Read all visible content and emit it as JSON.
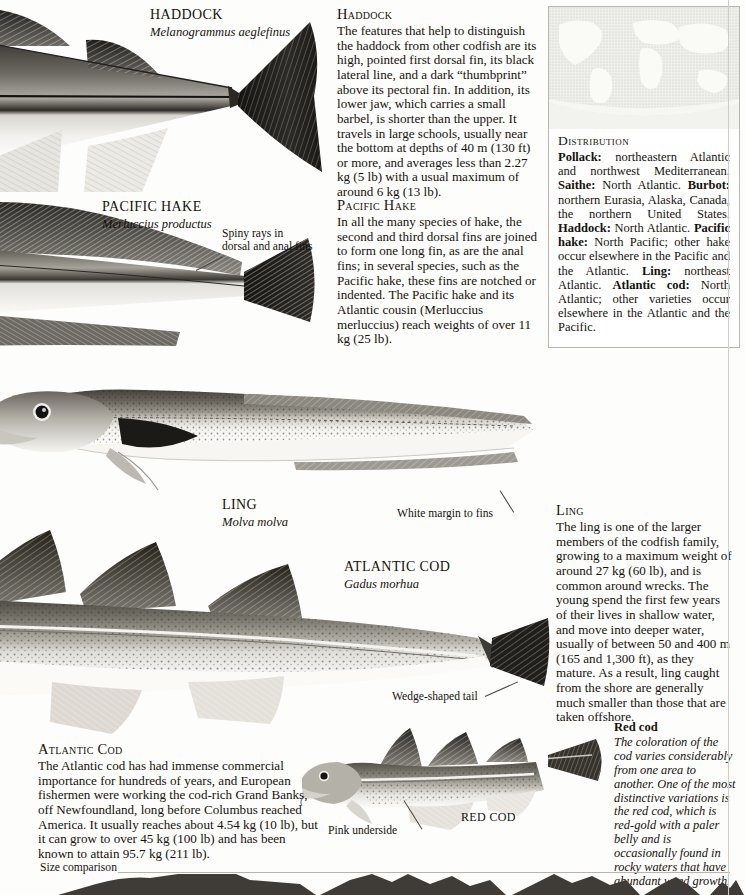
{
  "page": {
    "edge_title": "COD, HAKE, LING & BURBOT",
    "background_color": "#fdfdfb",
    "ink_color": "#15120d"
  },
  "specimens": [
    {
      "id": "haddock",
      "common_name": "HADDOCK",
      "scientific_name": "Melanogrammus aeglefinus"
    },
    {
      "id": "pacific-hake",
      "common_name": "PACIFIC HAKE",
      "scientific_name": "Merluccius productus"
    },
    {
      "id": "ling",
      "common_name": "LING",
      "scientific_name": "Molva molva"
    },
    {
      "id": "atlantic-cod",
      "common_name": "ATLANTIC COD",
      "scientific_name": "Gadus morhua"
    },
    {
      "id": "red-cod",
      "common_name": "RED COD",
      "scientific_name": ""
    }
  ],
  "callouts": {
    "spiny_rays": "Spiny rays in\ndorsal and anal fins",
    "spiny_rays_l1": "Spiny rays in",
    "spiny_rays_l2": "dorsal and anal fins",
    "white_margin": "White margin to fins",
    "wedge_tail": "Wedge-shaped tail",
    "pink_underside": "Pink underside"
  },
  "articles": [
    {
      "id": "haddock-article",
      "heading": "Haddock",
      "body": "The features that help to distinguish the haddock from other codfish are its high, pointed first dorsal fin, its black lateral line, and a dark “thumbprint” above its pectoral fin. In addition, its lower jaw, which carries a small barbel, is shorter than the upper. It travels in large schools, usually near the bottom at depths of 40 m (130 ft) or more, and averages less than 2.27 kg (5 lb) with a usual maximum of around 6 kg (13 lb)."
    },
    {
      "id": "pacific-hake-article",
      "heading": "Pacific Hake",
      "body": "In all the many species of hake, the second and third dorsal fins are joined to form one long fin, as are the anal fins; in several species, such as the Pacific hake, these fins are notched or indented. The Pacific hake and its Atlantic cousin (Merluccius merluccius) reach weights of over 11 kg (25 lb)."
    },
    {
      "id": "ling-article",
      "heading": "Ling",
      "body": "The ling is one of the larger members of the codfish family, growing to a maximum weight of around 27 kg (60 lb), and is common around wrecks. The young spend the first few years of their lives in shallow water, and move into deeper water, usually of between 50 and 400 m (165 and 1,300 ft), as they mature. As a result, ling caught from the shore are generally much smaller than those that are taken offshore."
    },
    {
      "id": "atlantic-cod-article",
      "heading": "Atlantic Cod",
      "body": "The Atlantic cod has had immense commercial importance for hundreds of years, and European fishermen were working the cod-rich Grand Banks, off Newfoundland, long before Columbus reached America. It usually reaches about 4.54 kg (10 lb), but it can grow to over 45 kg (100 lb) and has been known to attain 95.7 kg (211 lb)."
    }
  ],
  "distribution": {
    "title": "Distribution",
    "entries": [
      {
        "species": "Pollack:",
        "range": " northeastern Atlantic and northwest Mediterranean."
      },
      {
        "species": "Saithe:",
        "range": " North Atlantic."
      },
      {
        "species": "Burbot:",
        "range": " northern Eurasia, Alaska, Canada, the northern United States."
      },
      {
        "species": "Haddock:",
        "range": " North Atlantic."
      },
      {
        "species": "Pacific hake:",
        "range": " North Pacific; other hake occur elsewhere in the Pacific and the Atlantic."
      },
      {
        "species": "Ling:",
        "range": " northeast Atlantic."
      },
      {
        "species": "Atlantic cod:",
        "range": " North Atlantic; other varieties occur elsewhere in the Atlantic and the Pacific."
      }
    ]
  },
  "red_cod_note": {
    "heading": "Red cod",
    "body": "The coloration of the cod varies considerably from one area to another. One of the most distinctive variations is the red cod, which is red-gold with a paler belly and is occasionally found in rocky waters that have abundant weed growth."
  },
  "size_comparison": {
    "label": "Size comparison"
  }
}
